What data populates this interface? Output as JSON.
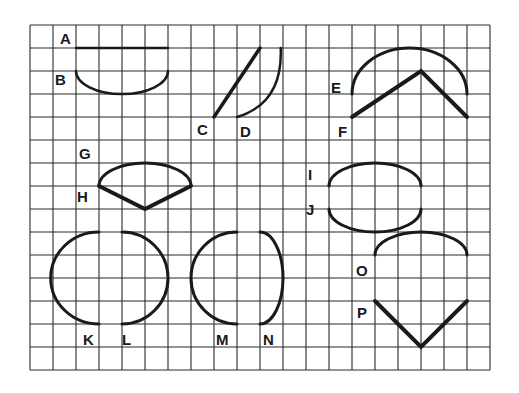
{
  "grid": {
    "origin_x": 30,
    "origin_y": 25,
    "cell": 23,
    "cols": 20,
    "rows": 15,
    "line_color": "#2a2a2a",
    "shape_color": "#1a1a1a"
  },
  "shapes": [
    {
      "id": "A",
      "type": "line",
      "points": [
        [
          2,
          1
        ],
        [
          6,
          1
        ]
      ],
      "width": 2.5
    },
    {
      "id": "B",
      "type": "arc",
      "from": [
        2,
        2
      ],
      "to": [
        6,
        2
      ],
      "bulge": [
        4,
        3
      ],
      "width": 2.5
    },
    {
      "id": "C",
      "type": "line",
      "points": [
        [
          8,
          4
        ],
        [
          10,
          1
        ]
      ],
      "width": 3.5
    },
    {
      "id": "D",
      "type": "curve",
      "from": [
        9,
        4
      ],
      "ctrl": [
        11,
        3.4
      ],
      "to": [
        10.9,
        1
      ],
      "width": 2.5
    },
    {
      "id": "E",
      "type": "arc",
      "from": [
        14,
        3
      ],
      "to": [
        19,
        3
      ],
      "bulge": [
        17,
        1
      ],
      "width": 3
    },
    {
      "id": "F",
      "type": "polyline",
      "points": [
        [
          14,
          4
        ],
        [
          17,
          2
        ],
        [
          19,
          4
        ]
      ],
      "width": 4
    },
    {
      "id": "G",
      "type": "arc",
      "from": [
        3,
        7
      ],
      "to": [
        7,
        7
      ],
      "bulge": [
        5,
        6
      ],
      "width": 3
    },
    {
      "id": "H",
      "type": "polyline",
      "points": [
        [
          3,
          7
        ],
        [
          5,
          8
        ],
        [
          7,
          7
        ]
      ],
      "width": 4
    },
    {
      "id": "I",
      "type": "arc",
      "from": [
        13,
        7
      ],
      "to": [
        17,
        7
      ],
      "bulge": [
        15,
        6
      ],
      "width": 3
    },
    {
      "id": "J",
      "type": "arc",
      "from": [
        13,
        8
      ],
      "to": [
        17,
        8
      ],
      "bulge": [
        15,
        9
      ],
      "width": 3
    },
    {
      "id": "K",
      "type": "halfoval",
      "from": [
        3,
        9
      ],
      "to": [
        3,
        13
      ],
      "bulge_x": 0.9,
      "width": 3
    },
    {
      "id": "L",
      "type": "halfoval",
      "from": [
        4,
        9
      ],
      "to": [
        4,
        13
      ],
      "bulge_x": 6,
      "width": 3
    },
    {
      "id": "M",
      "type": "halfoval",
      "from": [
        9,
        9
      ],
      "to": [
        9,
        13
      ],
      "bulge_x": 7,
      "width": 3
    },
    {
      "id": "N",
      "type": "halfoval",
      "from": [
        10,
        9
      ],
      "to": [
        10,
        13
      ],
      "bulge_x": 11,
      "width": 3
    },
    {
      "id": "O",
      "type": "arc",
      "from": [
        15,
        10
      ],
      "to": [
        19,
        10
      ],
      "bulge": [
        17,
        9
      ],
      "width": 3
    },
    {
      "id": "P",
      "type": "polyline",
      "points": [
        [
          15,
          12
        ],
        [
          17,
          14
        ],
        [
          19,
          12
        ]
      ],
      "width": 4
    }
  ],
  "labels": [
    {
      "text": "A",
      "x": 60,
      "y": 31
    },
    {
      "text": "B",
      "x": 55,
      "y": 72
    },
    {
      "text": "C",
      "x": 197,
      "y": 122
    },
    {
      "text": "D",
      "x": 240,
      "y": 124
    },
    {
      "text": "E",
      "x": 331,
      "y": 80
    },
    {
      "text": "F",
      "x": 338,
      "y": 124
    },
    {
      "text": "G",
      "x": 79,
      "y": 146
    },
    {
      "text": "H",
      "x": 77,
      "y": 189
    },
    {
      "text": "I",
      "x": 308,
      "y": 167
    },
    {
      "text": "J",
      "x": 306,
      "y": 202
    },
    {
      "text": "K",
      "x": 83,
      "y": 332
    },
    {
      "text": "L",
      "x": 122,
      "y": 332
    },
    {
      "text": "M",
      "x": 216,
      "y": 332
    },
    {
      "text": "N",
      "x": 263,
      "y": 332
    },
    {
      "text": "O",
      "x": 356,
      "y": 263
    },
    {
      "text": "P",
      "x": 357,
      "y": 305
    }
  ]
}
